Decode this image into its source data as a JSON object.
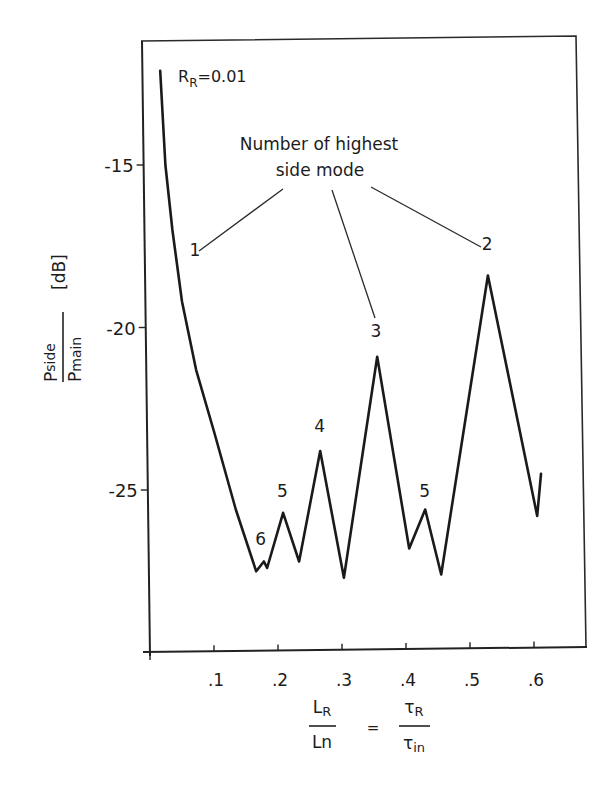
{
  "chart_data": {
    "type": "line",
    "title": "",
    "annotation_parameter": "R_R=0.01",
    "parameter": {
      "symbol": "R",
      "subscript": "R",
      "value_text": "=0.01"
    },
    "xlabel": "L_R / Ln = τ_R / τ_in",
    "ylabel": "P_side / P_main [dB]",
    "xlim": [
      0,
      0.68
    ],
    "ylim": [
      -30,
      -10.7
    ],
    "grid": false,
    "legend": null,
    "x_ticks": [
      0.1,
      0.2,
      0.3,
      0.4,
      0.5,
      0.6
    ],
    "x_tick_labels": [
      ".1",
      ".2",
      ".3",
      ".4",
      ".5",
      ".6"
    ],
    "y_ticks": [
      -15,
      -20,
      -25
    ],
    "y_tick_labels": [
      "-15",
      "-20",
      "-25"
    ],
    "series": [
      {
        "name": "Side mode suppression, R_R=0.01",
        "x": [
          0.016,
          0.024,
          0.035,
          0.05,
          0.072,
          0.1,
          0.134,
          0.166,
          0.178,
          0.183,
          0.208,
          0.233,
          0.266,
          0.303,
          0.355,
          0.405,
          0.43,
          0.455,
          0.528,
          0.605,
          0.611
        ],
        "y": [
          -12.1,
          -15.0,
          -17.0,
          -19.2,
          -21.3,
          -23.2,
          -25.6,
          -27.5,
          -27.2,
          -27.4,
          -25.7,
          -27.2,
          -23.8,
          -27.7,
          -20.9,
          -26.8,
          -25.6,
          -27.6,
          -18.4,
          -25.8,
          -24.5
        ]
      }
    ],
    "annotations": {
      "heading_line1": "Number of highest",
      "heading_line2": "side mode",
      "mode_labels": [
        {
          "text": "1",
          "x": 0.07,
          "y": -17.8
        },
        {
          "text": "2",
          "x": 0.527,
          "y": -17.6
        },
        {
          "text": "3",
          "x": 0.353,
          "y": -20.3
        },
        {
          "text": "4",
          "x": 0.265,
          "y": -23.2
        },
        {
          "text": "5",
          "x": 0.207,
          "y": -25.2
        },
        {
          "text": "5",
          "x": 0.429,
          "y": -25.2
        },
        {
          "text": "6",
          "x": 0.173,
          "y": -26.7
        }
      ]
    }
  },
  "labels": {
    "y_axis": {
      "num": "P",
      "num_sub": "side",
      "den": "P",
      "den_sub": "main",
      "unit": "[dB]"
    },
    "x_axis": {
      "l_num": "L",
      "l_num_sub": "R",
      "l_den": "Ln",
      "equals": "=",
      "r_num": "τ",
      "r_num_sub": "R",
      "r_den": "τ",
      "r_den_sub": "in"
    }
  }
}
